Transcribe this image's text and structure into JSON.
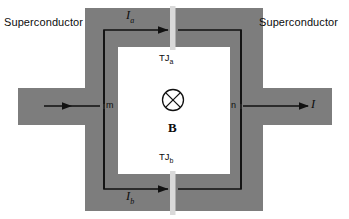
{
  "figure": {
    "type": "diagram",
    "background_color": "#ffffff",
    "superconductor_fill": "#7d7d7d",
    "loop_interior_color": "#ffffff",
    "junction_color": "#d9d9d9",
    "wire_color": "#111111",
    "text_color": "#0d0d0d"
  },
  "labels": {
    "superconductor_left": "Superconductor",
    "superconductor_right": "Superconductor",
    "current_top": "I",
    "current_top_sub": "a",
    "current_bottom": "I",
    "current_bottom_sub": "b",
    "current_total": "I",
    "junction_top": "TJ",
    "junction_top_sub": "a",
    "junction_bottom": "TJ",
    "junction_bottom_sub": "b",
    "node_left": "m",
    "node_right": "n",
    "field_symbol": "B",
    "field_direction_glyph": "into-page"
  }
}
